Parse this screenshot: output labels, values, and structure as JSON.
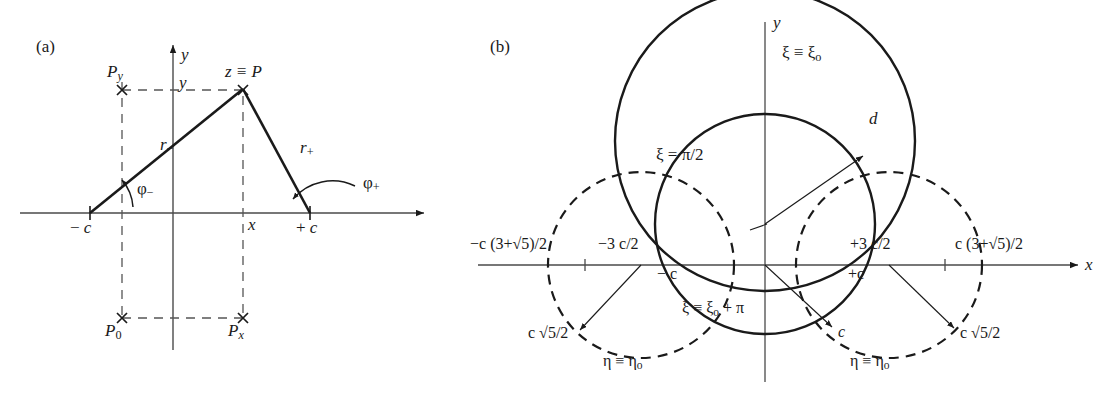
{
  "figure": {
    "domain": "diagram",
    "background_color": "#ffffff",
    "line_color": "#1a1a1a"
  },
  "panel_a": {
    "tag": "(a)",
    "axis_labels": {
      "y_axis": "y",
      "x_axis": "x"
    },
    "points": [
      {
        "name": "P_y",
        "label_main": "P",
        "label_sub": "y",
        "x": 122,
        "y": 90
      },
      {
        "name": "P",
        "label_main": "z ≡ P",
        "x": 243,
        "y": 90
      },
      {
        "name": "P_0",
        "label_main": "P",
        "label_sub": "0",
        "x": 122,
        "y": 318
      },
      {
        "name": "P_x",
        "label_main": "P",
        "label_sub": "x",
        "x": 243,
        "y": 318
      }
    ],
    "foci": [
      {
        "name": "minus-c",
        "label_sign": "−",
        "label_var": "c",
        "x": 90,
        "y": 213
      },
      {
        "name": "plus-c",
        "label_sign": "+",
        "label_var": "c",
        "x": 310,
        "y": 213
      }
    ],
    "segments": [
      {
        "name": "r-minus",
        "label_main": "r",
        "label_sub": "−",
        "from": [
          90,
          213
        ],
        "to": [
          243,
          90
        ]
      },
      {
        "name": "r-plus",
        "label_main": "r",
        "label_sub": "+",
        "from": [
          243,
          90
        ],
        "to": [
          310,
          213
        ]
      }
    ],
    "angles": [
      {
        "name": "phi-minus",
        "label_main": "φ",
        "label_sub": "−"
      },
      {
        "name": "phi-plus",
        "label_main": "φ",
        "label_sub": "+"
      }
    ],
    "inner_labels": {
      "y_coordinate": "y",
      "x_coordinate": "x"
    },
    "origin": {
      "x": 173,
      "y": 213
    }
  },
  "panel_b": {
    "tag": "(b)",
    "axis_labels": {
      "y_axis": "y",
      "x_axis": "x"
    },
    "origin": {
      "x": 765,
      "y": 265
    },
    "scale_c_px": 83,
    "curves": [
      {
        "name": "xi-zero-circle",
        "style": "solid",
        "label": "ξ ≡ ξ₀",
        "label_main": "ξ ≡ ξ",
        "label_sub": "o",
        "center": [
          765,
          141
        ],
        "radius": 150
      },
      {
        "name": "xi-zero-plus-pi-circle",
        "style": "solid",
        "label": "ξ ≡ ξ₀ + π",
        "label_main": "ξ ≡ ξ",
        "label_sub": "o",
        "label_tail": " + π",
        "center": [
          765,
          224
        ],
        "radius": 110
      },
      {
        "name": "eta-zero-circle-left",
        "style": "dashed",
        "label": "η ≡ η₀",
        "label_main": "η ≡ η",
        "label_sub": "o",
        "center": [
          641,
          265
        ],
        "radius": 93
      },
      {
        "name": "eta-zero-circle-right",
        "style": "dashed",
        "label": "η ≡ η₀",
        "label_main": "η ≡ η",
        "label_sub": "o",
        "center": [
          889,
          265
        ],
        "radius": 93
      }
    ],
    "x_axis_ticks": [
      {
        "name": "tick-neg-c-3plussqrt5-over-2",
        "text": "−c (3+√5)/2",
        "x": 585
      },
      {
        "name": "tick-neg-3c-over-2",
        "text": "−3 c/2",
        "x": 641
      },
      {
        "name": "tick-neg-c",
        "text": "− c",
        "x": 682
      },
      {
        "name": "tick-plus-c",
        "text": "+c",
        "x": 848
      },
      {
        "name": "tick-plus-3c-over-2",
        "text": "+3 c/2",
        "x": 889
      },
      {
        "name": "tick-c-3plussqrt5-over-2",
        "text": "c (3+√5)/2",
        "x": 945
      }
    ],
    "radius_callouts": [
      {
        "name": "radius-d",
        "label": "d",
        "from": [
          765,
          224
        ],
        "to": [
          866,
          155
        ]
      },
      {
        "name": "radius-left-sqrt5",
        "label": "c √5/2",
        "from": [
          641,
          265
        ],
        "to": [
          577,
          332
        ]
      },
      {
        "name": "radius-center-c",
        "label": "c",
        "from": [
          765,
          265
        ],
        "to": [
          838,
          330
        ]
      },
      {
        "name": "radius-right-sqrt5",
        "label": "c √5/2",
        "from": [
          889,
          265
        ],
        "to": [
          956,
          330
        ]
      }
    ],
    "xi_half_pi_label": {
      "name": "xi-equals-pi-over-2",
      "text": "ξ = π/2"
    }
  }
}
